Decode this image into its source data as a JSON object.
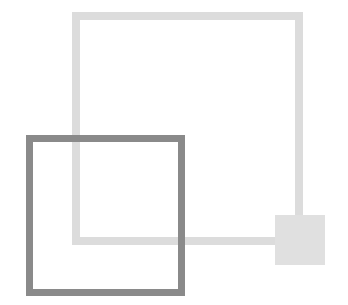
{
  "diagram": {
    "description": "Overlapping squares logo mark",
    "background": "#ffffff",
    "shapes": [
      {
        "id": "large-outline-square",
        "kind": "outline-square",
        "x": 72,
        "y": 12,
        "width": 231,
        "height": 233,
        "stroke_width": 8,
        "stroke_color": "#dcdcdc",
        "fill": "transparent",
        "z": 1
      },
      {
        "id": "small-filled-square",
        "kind": "filled-square",
        "x": 275,
        "y": 215,
        "width": 50,
        "height": 50,
        "fill": "#e0e0e0",
        "z": 2
      },
      {
        "id": "dark-outline-square",
        "kind": "outline-square",
        "x": 26,
        "y": 135,
        "width": 159,
        "height": 161,
        "stroke_width": 7,
        "stroke_color": "#8a8a8a",
        "fill": "transparent",
        "z": 3
      }
    ]
  }
}
